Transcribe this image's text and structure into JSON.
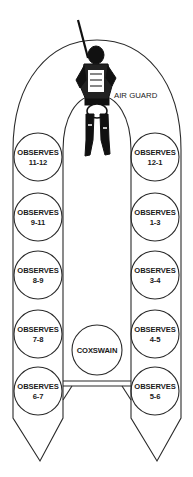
{
  "figure": {
    "air_guard_label": "AIR GUARD",
    "coxswain_label": "COXSWAIN",
    "observer_word": "OBSERVES",
    "port_stations": [
      {
        "line1": "OBSERVES",
        "line2": "11-12"
      },
      {
        "line1": "OBSERVES",
        "line2": "9-11"
      },
      {
        "line1": "OBSERVES",
        "line2": "8-9"
      },
      {
        "line1": "OBSERVES",
        "line2": "7-8"
      },
      {
        "line1": "OBSERVES",
        "line2": "6-7"
      }
    ],
    "starboard_stations": [
      {
        "line1": "OBSERVES",
        "line2": "12-1"
      },
      {
        "line1": "OBSERVES",
        "line2": "1-3"
      },
      {
        "line1": "OBSERVES",
        "line2": "3-4"
      },
      {
        "line1": "OBSERVES",
        "line2": "4-5"
      },
      {
        "line1": "OBSERVES",
        "line2": "5-6"
      }
    ]
  }
}
